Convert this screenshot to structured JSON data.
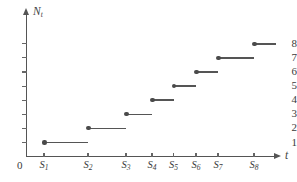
{
  "chart_data": {
    "type": "line",
    "subtype": "step-function",
    "title": "",
    "xlabel": "t",
    "ylabel": "N_t",
    "grid": false,
    "legend": null,
    "x_tick_labels": [
      "S1",
      "S2",
      "S3",
      "S4",
      "S5",
      "S6",
      "S7",
      "S8"
    ],
    "x_tick_labels_display": [
      "S₁",
      "S₂",
      "S₃",
      "S₄",
      "S₅",
      "S₆",
      "S₇",
      "S₈"
    ],
    "y_tick_labels": [
      "1",
      "2",
      "3",
      "4",
      "5",
      "6",
      "7",
      "8"
    ],
    "y_values": [
      1,
      2,
      3,
      4,
      5,
      6,
      7,
      8
    ],
    "ylim": [
      0,
      8.8
    ],
    "origin_label": "0",
    "jump_times": [
      "S1",
      "S2",
      "S3",
      "S4",
      "S5",
      "S6",
      "S7",
      "S8"
    ],
    "steps": [
      {
        "level": 1,
        "start_label": "S1",
        "end_label": "S2",
        "left_closed": true,
        "right_closed": false
      },
      {
        "level": 2,
        "start_label": "S2",
        "end_label": "S3",
        "left_closed": true,
        "right_closed": false
      },
      {
        "level": 3,
        "start_label": "S3",
        "end_label": "S4",
        "left_closed": true,
        "right_closed": false
      },
      {
        "level": 4,
        "start_label": "S4",
        "end_label": "S5",
        "left_closed": true,
        "right_closed": false
      },
      {
        "level": 5,
        "start_label": "S5",
        "end_label": "S6",
        "left_closed": true,
        "right_closed": false
      },
      {
        "level": 6,
        "start_label": "S6",
        "end_label": "S7",
        "left_closed": true,
        "right_closed": false
      },
      {
        "level": 7,
        "start_label": "S7",
        "end_label": "S8",
        "left_closed": true,
        "right_closed": false
      },
      {
        "level": 8,
        "start_label": "S8",
        "end_label": "",
        "left_closed": true,
        "right_closed": false
      }
    ],
    "colors": {
      "line": "#555555",
      "dot": "#4a4a4a",
      "axis": "#555555",
      "text": "#3a3a3a",
      "background": "#ffffff"
    }
  },
  "axes": {
    "y_caption_base": "N",
    "y_caption_sub": "t",
    "x_caption": "t",
    "origin": "0"
  },
  "y_ticks": [
    {
      "label": "8"
    },
    {
      "label": "7"
    },
    {
      "label": "6"
    },
    {
      "label": "5"
    },
    {
      "label": "4"
    },
    {
      "label": "3"
    },
    {
      "label": "2"
    },
    {
      "label": "1"
    }
  ],
  "x_ticks": [
    {
      "base": "S",
      "sub": "1"
    },
    {
      "base": "S",
      "sub": "2"
    },
    {
      "base": "S",
      "sub": "3"
    },
    {
      "base": "S",
      "sub": "4"
    },
    {
      "base": "S",
      "sub": "5"
    },
    {
      "base": "S",
      "sub": "6"
    },
    {
      "base": "S",
      "sub": "7"
    },
    {
      "base": "S",
      "sub": "8"
    }
  ]
}
